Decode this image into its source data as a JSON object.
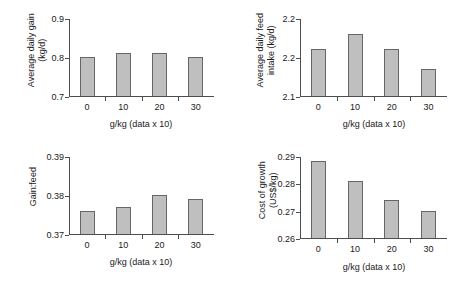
{
  "figure": {
    "panel_count": 4,
    "bar_fill_color": "#bfbfbf",
    "bar_border_color": "#666666",
    "axis_color": "#4d4d4d",
    "background_color": "#ffffff"
  },
  "chart_data": [
    {
      "id": "average-daily-gain",
      "type": "bar",
      "title": "",
      "xlabel": "g/kg (data x 10)",
      "ylabel": "Average daily gain (kg/d)",
      "ylabel_lines": [
        "Average daily gain",
        "(kg/d)"
      ],
      "categories": [
        "0",
        "10",
        "20",
        "30"
      ],
      "values": [
        0.8,
        0.81,
        0.81,
        0.8
      ],
      "ylim": [
        0.7,
        0.9
      ],
      "yticks": [
        0.7,
        0.8,
        0.9
      ],
      "ytick_labels": [
        "0.7",
        "0.8",
        "0.9"
      ],
      "grid": false,
      "legend": false
    },
    {
      "id": "average-daily-feed-intake",
      "type": "bar",
      "title": "",
      "xlabel": "g/kg (data x 10)",
      "ylabel": "Average daily feed intake (kg/d)",
      "ylabel_lines": [
        "Average daily feed",
        "intake (kg/d)"
      ],
      "categories": [
        "0",
        "10",
        "20",
        "30"
      ],
      "values": [
        2.22,
        2.26,
        2.22,
        2.17
      ],
      "ylim": [
        2.1,
        2.3
      ],
      "yticks": [
        2.1,
        2.2,
        2.3
      ],
      "ytick_labels": [
        "2.1",
        "2.2",
        "2.2"
      ],
      "grid": false,
      "legend": false
    },
    {
      "id": "gain-feed",
      "type": "bar",
      "title": "",
      "xlabel": "g/kg (data x 10)",
      "ylabel": "Gain:feed",
      "ylabel_lines": [
        "Gain:feed"
      ],
      "categories": [
        "0",
        "10",
        "20",
        "30"
      ],
      "values": [
        0.376,
        0.377,
        0.38,
        0.379
      ],
      "ylim": [
        0.37,
        0.39
      ],
      "yticks": [
        0.37,
        0.38,
        0.39
      ],
      "ytick_labels": [
        "0.37",
        "0.38",
        "0.39"
      ],
      "grid": false,
      "legend": false
    },
    {
      "id": "cost-of-growth",
      "type": "bar",
      "title": "",
      "xlabel": "g/kg (data x 10)",
      "ylabel": "Cost of growth (US$/kg)",
      "ylabel_lines": [
        "Cost of growth",
        "(US$/kg)"
      ],
      "categories": [
        "0",
        "10",
        "20",
        "30"
      ],
      "values": [
        0.288,
        0.281,
        0.274,
        0.27
      ],
      "ylim": [
        0.26,
        0.29
      ],
      "yticks": [
        0.26,
        0.27,
        0.28,
        0.29
      ],
      "ytick_labels": [
        "0.26",
        "0.27",
        "0.28",
        "0.29"
      ],
      "grid": false,
      "legend": false
    }
  ]
}
